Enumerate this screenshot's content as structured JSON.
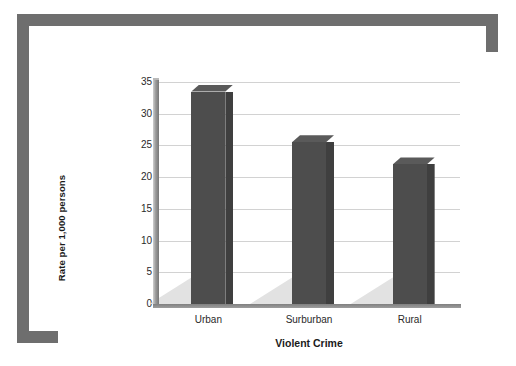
{
  "figure": {
    "frame_color": "#6e6e6e",
    "background_color": "#ffffff"
  },
  "chart_data": {
    "type": "bar",
    "title": "",
    "subtitle": "",
    "xlabel": "Violent Crime",
    "ylabel": "Rate per 1,000 persons",
    "categories": [
      "Urban",
      "Surburban",
      "Rural"
    ],
    "values": [
      33.5,
      25.5,
      22.0
    ],
    "ylim": [
      0,
      35
    ],
    "ytick_labels": [
      "0",
      "5",
      "10",
      "15",
      "20",
      "25",
      "30",
      "35"
    ],
    "ytick_values": [
      0,
      5,
      10,
      15,
      20,
      25,
      30,
      35
    ],
    "grid": true,
    "legend": "none",
    "bar_color": "#4d4d4d",
    "bar_side_color": "#3f3f3f",
    "bar_top_color": "#5a5a5a",
    "gridline_color": "#d2d2d2",
    "floor_color": "#e2e2e2",
    "style": "3d-column"
  }
}
